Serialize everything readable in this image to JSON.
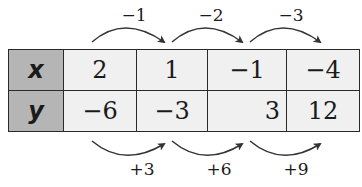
{
  "table": {
    "rows": [
      {
        "header": "x",
        "values": [
          "2",
          "1",
          "−1",
          "−4"
        ]
      },
      {
        "header": "y",
        "values": [
          "−6",
          "−3",
          "3",
          "12"
        ]
      }
    ]
  },
  "top_arrows": [
    {
      "label": "−1"
    },
    {
      "label": "−2"
    },
    {
      "label": "−3"
    }
  ],
  "bottom_arrows": [
    {
      "label": "+3"
    },
    {
      "label": "+6"
    },
    {
      "label": "+9"
    }
  ],
  "colors": {
    "header_fill": "#b5b5b5",
    "cell_fill": "#f0f0f0",
    "border": "#2a2a2a",
    "arrow": "#333333"
  }
}
